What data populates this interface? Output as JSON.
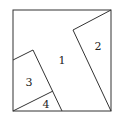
{
  "diagram": {
    "type": "square-dissection",
    "stroke_color": "#333333",
    "background": "#ffffff",
    "square": {
      "x1": 13,
      "y1": 10,
      "x2": 111,
      "y2": 111
    },
    "regions": [
      {
        "id": "1",
        "label": "1",
        "label_pos": [
          62,
          60
        ]
      },
      {
        "id": "2",
        "label": "2",
        "label_pos": [
          98,
          46
        ]
      },
      {
        "id": "3",
        "label": "3",
        "label_pos": [
          29,
          82
        ]
      },
      {
        "id": "4",
        "label": "4",
        "label_pos": [
          46,
          104
        ]
      }
    ],
    "lines": [
      {
        "name": "region-2-top-edge",
        "from": [
          73,
          30
        ],
        "to": [
          111,
          10
        ]
      },
      {
        "name": "region-2-diagonal-edge",
        "from": [
          73,
          30
        ],
        "to": [
          111,
          111
        ]
      },
      {
        "name": "region-3-top-edge",
        "from": [
          13,
          60
        ],
        "to": [
          33,
          50
        ]
      },
      {
        "name": "region-3-right-edge",
        "from": [
          33,
          50
        ],
        "to": [
          62,
          111
        ]
      },
      {
        "name": "region-4-top-edge",
        "from": [
          13,
          111
        ],
        "to": [
          53,
          91
        ]
      }
    ]
  }
}
